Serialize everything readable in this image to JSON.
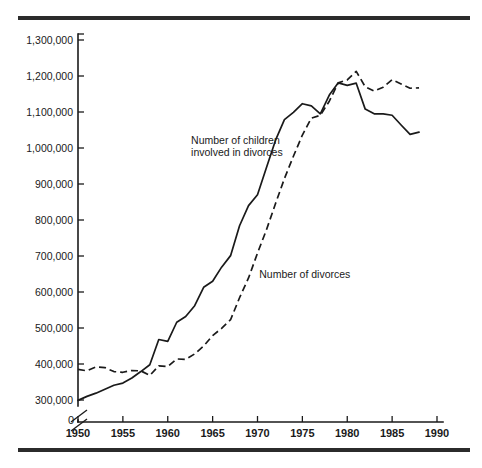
{
  "figure": {
    "top_rule": "horizontal-rule",
    "bottom_rule": "horizontal-rule"
  },
  "chart_data": {
    "type": "line",
    "title": "",
    "subtitle": "",
    "xlabel": "",
    "ylabel": "",
    "grid": false,
    "legend_position": "inline-annotations",
    "xlim": [
      1950,
      1990
    ],
    "ylim": [
      300000,
      1300000
    ],
    "y_axis_break": true,
    "y_axis_break_note": "axis broken between 0 and 300,000",
    "xticks": [
      1950,
      1955,
      1960,
      1965,
      1970,
      1975,
      1980,
      1985,
      1990
    ],
    "xtick_labels": [
      "1950",
      "1955",
      "1960",
      "1965",
      "1970",
      "1975",
      "1980",
      "1985",
      "1990"
    ],
    "yticks": [
      300000,
      400000,
      500000,
      600000,
      700000,
      800000,
      900000,
      1000000,
      1100000,
      1200000,
      1300000
    ],
    "ytick_labels": [
      "300,000",
      "400,000",
      "500,000",
      "600,000",
      "700,000",
      "800,000",
      "900,000",
      "1,000,000",
      "1,100,000",
      "1,200,000",
      "1,300,000"
    ],
    "origin_label": "0",
    "annotations": [
      {
        "name": "children-series-label",
        "text_line1": "Number of children",
        "text_line2": "involved in divorces",
        "x": 1962.6,
        "y": 1010000
      },
      {
        "name": "divorces-series-label",
        "text_line1": "Number of divorces",
        "text_line2": "",
        "x": 1970.2,
        "y": 640000
      }
    ],
    "series": [
      {
        "name": "Number of children involved in divorces",
        "style": "solid",
        "x": [
          1950,
          1951,
          1952,
          1953,
          1954,
          1955,
          1956,
          1957,
          1958,
          1959,
          1960,
          1961,
          1962,
          1963,
          1964,
          1965,
          1966,
          1967,
          1968,
          1969,
          1970,
          1971,
          1972,
          1973,
          1974,
          1975,
          1976,
          1977,
          1978,
          1979,
          1980,
          1981,
          1982,
          1983,
          1984,
          1985,
          1986,
          1987,
          1988
        ],
        "values": [
          299000,
          310000,
          319000,
          330000,
          341000,
          347000,
          361000,
          379000,
          398000,
          468000,
          463000,
          516000,
          532000,
          562000,
          613000,
          630000,
          669000,
          701000,
          784000,
          840000,
          870000,
          946000,
          1021000,
          1079000,
          1099000,
          1123000,
          1117000,
          1095000,
          1147000,
          1181000,
          1174000,
          1180000,
          1108000,
          1095000,
          1095000,
          1091000,
          1064000,
          1038000,
          1044000
        ]
      },
      {
        "name": "Number of divorces",
        "style": "dashed",
        "x": [
          1950,
          1951,
          1952,
          1953,
          1954,
          1955,
          1956,
          1957,
          1958,
          1959,
          1960,
          1961,
          1962,
          1963,
          1964,
          1965,
          1966,
          1967,
          1968,
          1969,
          1970,
          1971,
          1972,
          1973,
          1974,
          1975,
          1976,
          1977,
          1978,
          1979,
          1980,
          1981,
          1982,
          1983,
          1984,
          1985,
          1986,
          1987,
          1988
        ],
        "values": [
          385000,
          381000,
          392000,
          390000,
          379000,
          377000,
          382000,
          381000,
          368000,
          395000,
          393000,
          414000,
          413000,
          428000,
          450000,
          479000,
          499000,
          523000,
          584000,
          639000,
          708000,
          773000,
          845000,
          915000,
          977000,
          1036000,
          1083000,
          1091000,
          1130000,
          1181000,
          1189000,
          1213000,
          1170000,
          1158000,
          1169000,
          1190000,
          1178000,
          1166000,
          1167000
        ]
      }
    ]
  }
}
